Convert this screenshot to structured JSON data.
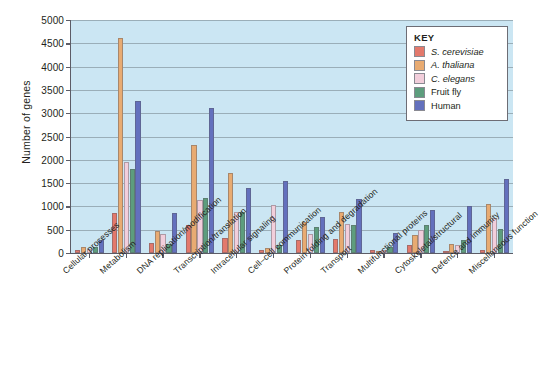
{
  "chart_data": {
    "type": "bar",
    "title": "",
    "xlabel": "",
    "ylabel": "Number of genes",
    "ylim": [
      0,
      5000
    ],
    "ytick_step": 500,
    "yticks": [
      "5000",
      "4500",
      "4000",
      "3500",
      "3000",
      "2500",
      "2000",
      "1500",
      "1000",
      "500",
      "0"
    ],
    "grid": true,
    "legend_position": "top-right",
    "legend_title": "KEY",
    "categories": [
      "Cellular processes",
      "Metabolism",
      "DNA replication/modification",
      "Transcription/translation",
      "Intracellular signaling",
      "Cell–cell communication",
      "Protein folding and degradation",
      "Transport",
      "Multifunctional proteins",
      "Cytoskeletal/structural",
      "Defence and immunity",
      "Miscellaneous function"
    ],
    "series": [
      {
        "name": "S. cerevisiae",
        "color": "#e3796c",
        "italic": true,
        "values": [
          54,
          860,
          220,
          600,
          330,
          55,
          290,
          300,
          60,
          180,
          30,
          70
        ]
      },
      {
        "name": "A. thaliana",
        "color": "#e8ab72",
        "italic": true,
        "values": [
          120,
          4620,
          480,
          2320,
          1710,
          110,
          670,
          870,
          45,
          380,
          200,
          1050
        ]
      },
      {
        "name": "C. elegans",
        "color": "#f2cedb",
        "italic": true,
        "values": [
          90,
          1960,
          410,
          1130,
          870,
          1030,
          410,
          620,
          60,
          500,
          180,
          750
        ]
      },
      {
        "name": "Fruit fly",
        "color": "#5d9d7d",
        "italic": false,
        "values": [
          130,
          1800,
          190,
          1170,
          880,
          180,
          560,
          600,
          130,
          600,
          290,
          520
        ]
      },
      {
        "name": "Human",
        "color": "#6370bd",
        "italic": false,
        "values": [
          270,
          3270,
          860,
          3120,
          1400,
          1540,
          780,
          1160,
          420,
          920,
          1010,
          1590
        ]
      }
    ]
  }
}
